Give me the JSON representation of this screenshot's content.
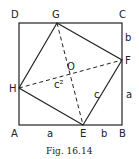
{
  "figure": {
    "caption": "Fig. 16.14",
    "vertices": {
      "A": "A",
      "B": "B",
      "C": "C",
      "D": "D",
      "E": "E",
      "F": "F",
      "G": "G",
      "H": "H",
      "O": "O"
    },
    "side_labels": {
      "bottom_left": "a",
      "bottom_right": "b",
      "right_top": "b",
      "right_bottom": "a",
      "hypotenuse": "c",
      "area": "c²"
    }
  }
}
